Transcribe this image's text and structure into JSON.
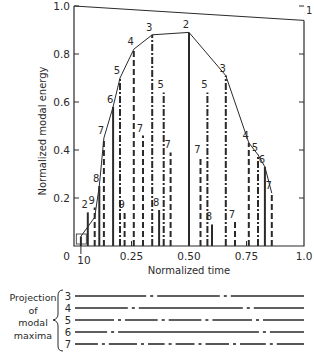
{
  "chart_data": {
    "type": "line",
    "title": "",
    "xlabel": "Normalized time",
    "ylabel": "Normalized modal energy",
    "xlim": [
      0,
      1.0
    ],
    "ylim": [
      0,
      1.0
    ],
    "x_ticks": [
      "0",
      "0.25",
      "0.50",
      "0.75",
      "1.0"
    ],
    "y_ticks": [
      "0.2",
      "0.4",
      "0.6",
      "0.8",
      "1.0"
    ],
    "extra_x_label": "10",
    "grid": false,
    "mode1_line": {
      "label": "1",
      "points": [
        [
          0,
          1.0
        ],
        [
          1.0,
          0.94
        ]
      ]
    },
    "envelope": {
      "points": [
        {
          "t": 0.03,
          "E": 0.04,
          "mode": "10"
        },
        {
          "t": 0.09,
          "E": 0.12,
          "mode": "9"
        },
        {
          "t": 0.11,
          "E": 0.25,
          "mode": "8"
        },
        {
          "t": 0.13,
          "E": 0.45,
          "mode": "7"
        },
        {
          "t": 0.17,
          "E": 0.58,
          "mode": "6"
        },
        {
          "t": 0.2,
          "E": 0.7,
          "mode": "5"
        },
        {
          "t": 0.26,
          "E": 0.82,
          "mode": "4"
        },
        {
          "t": 0.34,
          "E": 0.88,
          "mode": "3"
        },
        {
          "t": 0.5,
          "E": 0.89,
          "mode": "2"
        },
        {
          "t": 0.66,
          "E": 0.71,
          "mode": "3"
        },
        {
          "t": 0.76,
          "E": 0.43,
          "mode": "4"
        },
        {
          "t": 0.8,
          "E": 0.38,
          "mode": "5"
        },
        {
          "t": 0.83,
          "E": 0.33,
          "mode": "6"
        },
        {
          "t": 0.86,
          "E": 0.22,
          "mode": "7"
        }
      ]
    },
    "modal_maxima": [
      {
        "t": 0.03,
        "E": 0.04,
        "mode": "10",
        "style": "solid"
      },
      {
        "t": 0.06,
        "E": 0.14,
        "mode": "2",
        "style": "solid"
      },
      {
        "t": 0.09,
        "E": 0.16,
        "mode": "9",
        "style": "dash"
      },
      {
        "t": 0.11,
        "E": 0.25,
        "mode": "8",
        "style": "solid"
      },
      {
        "t": 0.13,
        "E": 0.45,
        "mode": "7",
        "style": "dash"
      },
      {
        "t": 0.17,
        "E": 0.58,
        "mode": "6",
        "style": "solid"
      },
      {
        "t": 0.2,
        "E": 0.7,
        "mode": "5",
        "style": "dashdot"
      },
      {
        "t": 0.22,
        "E": 0.14,
        "mode": "9",
        "style": "dash"
      },
      {
        "t": 0.26,
        "E": 0.82,
        "mode": "4",
        "style": "dash"
      },
      {
        "t": 0.3,
        "E": 0.46,
        "mode": "7",
        "style": "dash"
      },
      {
        "t": 0.34,
        "E": 0.88,
        "mode": "3",
        "style": "dashdot"
      },
      {
        "t": 0.37,
        "E": 0.15,
        "mode": "8",
        "style": "solid"
      },
      {
        "t": 0.39,
        "E": 0.64,
        "mode": "5",
        "style": "dashdot"
      },
      {
        "t": 0.42,
        "E": 0.39,
        "mode": "7",
        "style": "dash"
      },
      {
        "t": 0.5,
        "E": 0.89,
        "mode": "2",
        "style": "solid"
      },
      {
        "t": 0.55,
        "E": 0.37,
        "mode": "7",
        "style": "dash"
      },
      {
        "t": 0.58,
        "E": 0.64,
        "mode": "5",
        "style": "dashdot"
      },
      {
        "t": 0.6,
        "E": 0.09,
        "mode": "8",
        "style": "solid"
      },
      {
        "t": 0.66,
        "E": 0.71,
        "mode": "3",
        "style": "dashdot"
      },
      {
        "t": 0.7,
        "E": 0.1,
        "mode": "7",
        "style": "dash"
      },
      {
        "t": 0.76,
        "E": 0.43,
        "mode": "4",
        "style": "dash"
      },
      {
        "t": 0.8,
        "E": 0.38,
        "mode": "5",
        "style": "dashdot"
      },
      {
        "t": 0.83,
        "E": 0.33,
        "mode": "6",
        "style": "solid"
      },
      {
        "t": 0.86,
        "E": 0.22,
        "mode": "7",
        "style": "dash"
      }
    ],
    "projection": {
      "label": [
        "Projection",
        "of",
        "modal",
        "maxima"
      ],
      "rows": [
        {
          "mode": "3",
          "style": "solid-dashdot",
          "breaks": [
            0.34,
            0.66
          ]
        },
        {
          "mode": "4",
          "style": "solid-dashdot",
          "breaks": [
            0.26,
            0.76
          ]
        },
        {
          "mode": "5",
          "style": "dashdot",
          "breaks": [
            0.2,
            0.39,
            0.58,
            0.8
          ]
        },
        {
          "mode": "6",
          "style": "solid-dashdot",
          "breaks": [
            0.17,
            0.83
          ]
        },
        {
          "mode": "7",
          "style": "dashdot",
          "breaks": [
            0.13,
            0.3,
            0.42,
            0.55,
            0.7,
            0.86
          ]
        }
      ]
    }
  }
}
